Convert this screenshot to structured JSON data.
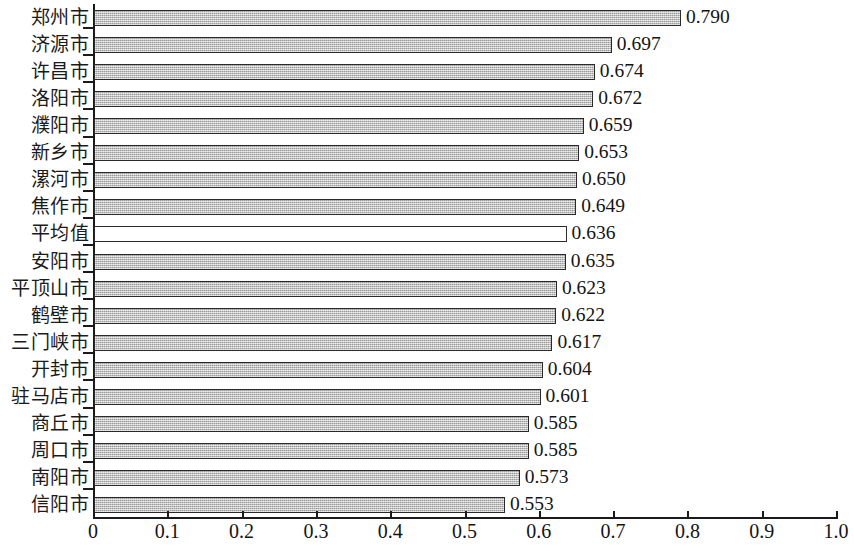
{
  "chart_data": {
    "type": "bar",
    "orientation": "horizontal",
    "title": "",
    "subtitle": "",
    "xlabel": "",
    "ylabel": "",
    "xlim": [
      0,
      1.0
    ],
    "grid": false,
    "legend": null,
    "x_ticks": [
      "0",
      "0.1",
      "0.2",
      "0.3",
      "0.4",
      "0.5",
      "0.6",
      "0.7",
      "0.8",
      "0.9",
      "1.0"
    ],
    "x_tick_values": [
      0,
      0.1,
      0.2,
      0.3,
      0.4,
      0.5,
      0.6,
      0.7,
      0.8,
      0.9,
      1.0
    ],
    "categories": [
      "郑州市",
      "济源市",
      "许昌市",
      "洛阳市",
      "濮阳市",
      "新乡市",
      "漯河市",
      "焦作市",
      "平均值",
      "安阳市",
      "平顶山市",
      "鹤壁市",
      "三门峡市",
      "开封市",
      "驻马店市",
      "商丘市",
      "周口市",
      "南阳市",
      "信阳市"
    ],
    "values": [
      0.79,
      0.697,
      0.674,
      0.672,
      0.659,
      0.653,
      0.65,
      0.649,
      0.636,
      0.635,
      0.623,
      0.622,
      0.617,
      0.604,
      0.601,
      0.585,
      0.585,
      0.573,
      0.553
    ],
    "value_labels": [
      "0.790",
      "0.697",
      "0.674",
      "0.672",
      "0.659",
      "0.653",
      "0.650",
      "0.649",
      "0.636",
      "0.635",
      "0.623",
      "0.622",
      "0.617",
      "0.604",
      "0.601",
      "0.585",
      "0.585",
      "0.573",
      "0.553"
    ],
    "highlight_index": 8,
    "colors": {
      "bar_fill": "#b9b9b9",
      "bar_edge": "#2a2a2a",
      "highlight_fill": "#ffffff",
      "axis": "#1a1a1a",
      "text": "#141414",
      "background": "#ffffff"
    }
  }
}
